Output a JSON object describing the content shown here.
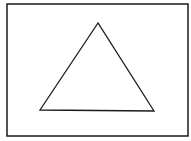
{
  "diagram": {
    "background": "#ffffff",
    "stroke_color": "#1a1a1a",
    "frame": {
      "shape": "rectangle",
      "x": 7,
      "y": 4,
      "width": 181,
      "height": 132,
      "stroke_width": 1.5
    },
    "figure": {
      "shape": "triangle",
      "points": "98,23 40,110 154,111",
      "stroke_width": 1.3,
      "fill": "none"
    }
  }
}
